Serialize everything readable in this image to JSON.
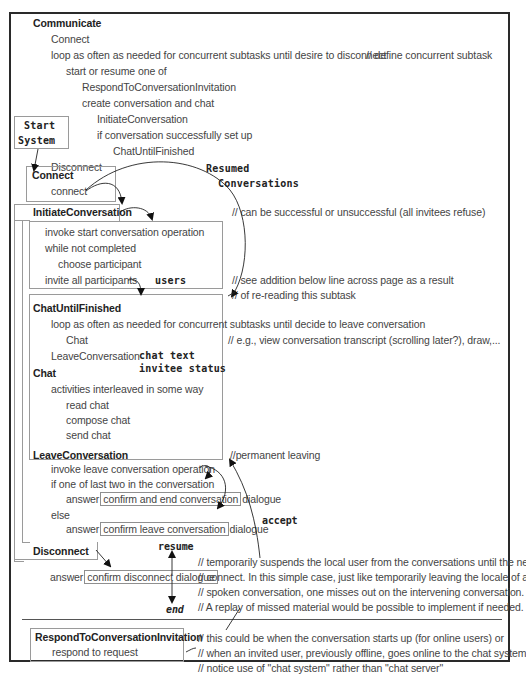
{
  "communicate": {
    "title": "Communicate",
    "lines": [
      "Connect",
      "loop as often as needed for concurrent subtasks until desire to disconnect",
      "start or resume one of",
      "RespondToConversationInvitation",
      "create conversation and chat",
      "InitiateConversation",
      "if conversation successfully set up",
      "ChatUntilFinished",
      "Disconnect"
    ],
    "comment": "// define concurrent subtask"
  },
  "start_system": {
    "line1": "Start",
    "line2": "System"
  },
  "connect": {
    "title": "Connect",
    "body": "connect"
  },
  "resumed_label": {
    "line1": "Resumed",
    "line2": "Conversations"
  },
  "initiate": {
    "title": "InitiateConversation",
    "comment": "// can be successful or unsuccessful (all invitees refuse)",
    "lines": [
      "invoke start conversation operation",
      "while not completed",
      "choose participant",
      "invite all participants"
    ],
    "users_label": "users",
    "comment2_line1": "// see addition below line across page as a result",
    "comment2_line2": "// of re-reading this subtask"
  },
  "chat_until_finished": {
    "title": "ChatUntilFinished",
    "lines": [
      "loop as often as needed for concurrent subtasks until decide to leave conversation",
      "Chat",
      "LeaveConversation"
    ],
    "comment": "// e.g., view conversation transcript (scrolling later?), draw,...",
    "chat_text_label": "chat text",
    "invitee_status_label": "invitee status"
  },
  "chat": {
    "title": "Chat",
    "lines": [
      "activities interleaved in some way",
      "read chat",
      "compose chat",
      "send chat"
    ]
  },
  "leave": {
    "title": "LeaveConversation",
    "comment": "//permanent leaving",
    "lines": [
      "invoke leave conversation operation",
      "if one of last two in the conversation",
      "else"
    ],
    "answer_word": "answer",
    "dialogue_word": "dialogue",
    "confirm_end": "confirm and end conversation",
    "confirm_leave": "confirm leave conversation",
    "accept_label": "accept"
  },
  "disconnect": {
    "title": "Disconnect",
    "answer_word": "answer",
    "confirm_disconnect": "confirm disconnect dialogue",
    "resume_label": "resume",
    "end_label": "end",
    "comments": [
      "// temporarily suspends the local user from the conversations until the next",
      "// connect. In this simple case, just like temporarily leaving the locale of a",
      "// spoken conversation, one misses out on the intervening conversation.",
      "// A replay of missed material would be possible to implement if needed."
    ]
  },
  "respond": {
    "title": "RespondToConversationInvitation",
    "body": "respond to request",
    "comments": [
      "// this could be when the conversation starts up (for online users) or",
      "// when an invited user, previously offline, goes online to the chat system",
      "// notice use of \"chat system\" rather than \"chat server\""
    ]
  }
}
